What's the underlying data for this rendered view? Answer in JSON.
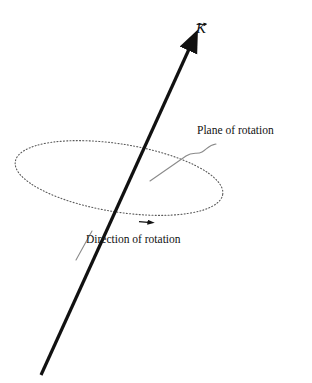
{
  "figure": {
    "title_visible": false,
    "background_color": "#ffffff",
    "width": 312,
    "height": 383
  },
  "labels": {
    "vector_k": "K",
    "vector_k_accent": "arrow-overbar",
    "plane_of_rotation": "Plane of rotation",
    "direction_of_rotation": "Direction of rotation"
  },
  "colors": {
    "vector_line": "#111111",
    "ellipse_stroke": "#5a5a5a",
    "leader_stroke": "#8a8a8a",
    "text": "#111111"
  },
  "geometry": {
    "axis_vector": {
      "tail_x": 41,
      "tail_y": 375,
      "tip_x": 192,
      "tip_y": 42,
      "stroke_width": 3.2,
      "arrowhead": "solid-triangle"
    },
    "rotation_ellipse": {
      "center_x": 119,
      "center_y": 178,
      "radius_x": 105,
      "radius_y": 34,
      "rotation_deg": 9,
      "dash_pattern": "1 2.2",
      "stroke_width": 1.1
    },
    "rotation_direction_arrow": {
      "x": 151,
      "y": 222,
      "direction": "right"
    },
    "plane_leader_line": {
      "start_x": 150,
      "start_y": 181,
      "end_x": 216,
      "end_y": 144,
      "shape": "s-curve"
    },
    "direction_leader_line": {
      "start_x": 78,
      "start_y": 258,
      "end_x": 92,
      "end_y": 232
    }
  }
}
